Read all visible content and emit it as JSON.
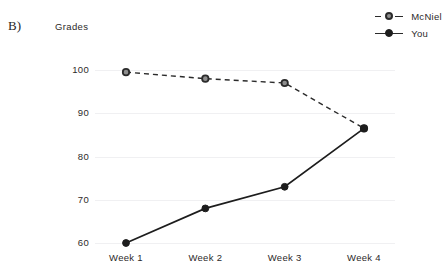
{
  "panel": {
    "label": "B)"
  },
  "axis_title": "Grades",
  "legend": {
    "items": [
      {
        "name": "McNiel",
        "style": "dashed",
        "marker": "ring",
        "color": "#2b2b2b"
      },
      {
        "name": "You",
        "style": "solid",
        "marker": "solid",
        "color": "#1d1d1d"
      }
    ]
  },
  "chart_data": {
    "type": "line",
    "title": "",
    "xlabel": "",
    "ylabel": "Grades",
    "categories": [
      "Week 1",
      "Week 2",
      "Week 3",
      "Week 4"
    ],
    "yticks": [
      60,
      70,
      80,
      90,
      100
    ],
    "ylim": [
      55,
      103
    ],
    "grid": true,
    "legend_position": "top-right",
    "series": [
      {
        "name": "McNiel",
        "values": [
          99.5,
          98,
          97,
          86.5
        ],
        "line": "dashed",
        "marker": "ring"
      },
      {
        "name": "You",
        "values": [
          60,
          68,
          73,
          86.5
        ],
        "line": "solid",
        "marker": "solid"
      }
    ]
  }
}
